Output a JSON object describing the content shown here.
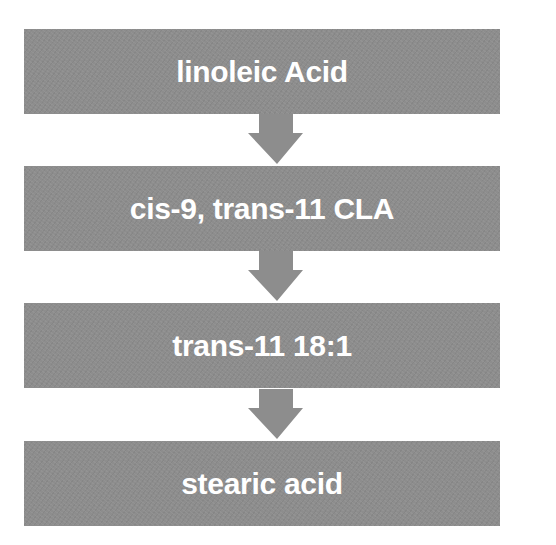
{
  "diagram": {
    "type": "vertical-flowchart",
    "colors": {
      "box_fill": "#8d8d8d",
      "arrow_fill": "#8d8d8d",
      "text": "#ffffff",
      "background": "#ffffff"
    },
    "steps": [
      {
        "label": "linoleic Acid"
      },
      {
        "label": "cis-9, trans-11 CLA"
      },
      {
        "label": "trans-11 18:1"
      },
      {
        "label": "stearic acid"
      }
    ],
    "connectors": [
      {
        "from": 0,
        "to": 1,
        "icon": "arrow-down-icon"
      },
      {
        "from": 1,
        "to": 2,
        "icon": "arrow-down-icon"
      },
      {
        "from": 2,
        "to": 3,
        "icon": "arrow-down-icon"
      }
    ]
  }
}
